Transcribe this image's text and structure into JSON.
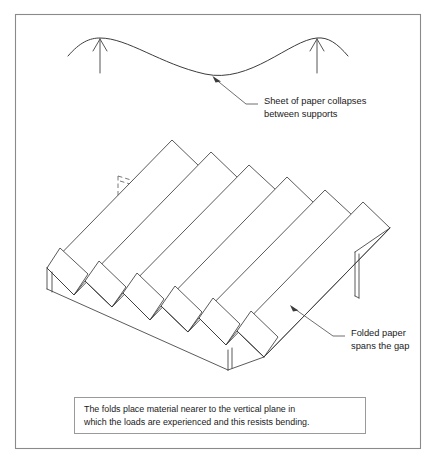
{
  "figure": {
    "title_present": false,
    "background_color": "#ffffff",
    "border_color": "#8a8a8a",
    "line_color": "#3c3c3c",
    "hidden_line_color": "#555555",
    "text_color": "#1a1a1a"
  },
  "annotations": {
    "sag_label_line1": "Sheet of paper collapses",
    "sag_label_line2": "between supports",
    "folded_label_line1": "Folded paper",
    "folded_label_line2": "spans the gap"
  },
  "caption": {
    "line1": "The folds place material nearer to the vertical plane in",
    "line2": "which the loads are experienced and this resists bending."
  },
  "diagram_top": {
    "description": "Sagging sheet of paper supported at two points with upward reaction arrows",
    "support_arrow_count": 2,
    "support_arrow_x": [
      100,
      317
    ],
    "sag_lowest_point_x": 205
  },
  "diagram_bottom": {
    "description": "Isometric view of folded corrugated paper spanning a gap",
    "fold_ridge_count": 6,
    "hidden_edges_shown": true,
    "end_support_count": 2
  }
}
